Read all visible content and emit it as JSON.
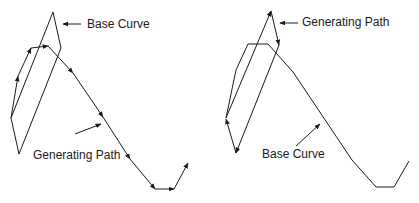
{
  "diagram": {
    "left": {
      "base_curve_label": "Base Curve",
      "generating_path_label": "Generating Path"
    },
    "right": {
      "generating_path_label": "Generating Path",
      "base_curve_label": "Base Curve"
    },
    "line_color": "#1a1a1a"
  }
}
